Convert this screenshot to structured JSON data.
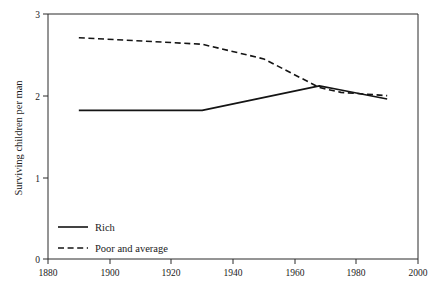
{
  "chart_data": {
    "type": "line",
    "title": "",
    "subtitle": "",
    "xlabel": "",
    "ylabel": "Surviving children per man",
    "xlim": [
      1880,
      2000
    ],
    "ylim": [
      0,
      3
    ],
    "xticks": [
      1880,
      1900,
      1920,
      1940,
      1960,
      1980,
      2000
    ],
    "xtick_labels": [
      "1880",
      "1900",
      "1920",
      "1940",
      "1960",
      "1980",
      "2000"
    ],
    "yticks": [
      0,
      1,
      2,
      3
    ],
    "ytick_labels": [
      "0",
      "1",
      "2",
      "3"
    ],
    "grid": false,
    "legend_position": "lower-left-inside",
    "series": [
      {
        "name": "Rich",
        "style": "solid",
        "color": "#141414",
        "x": [
          1890,
          1930,
          1968,
          1975,
          1990
        ],
        "values": [
          1.82,
          1.82,
          2.12,
          2.07,
          1.96
        ]
      },
      {
        "name": "Poor and average",
        "style": "dashed",
        "color": "#141414",
        "x": [
          1890,
          1930,
          1950,
          1968,
          1975,
          1990
        ],
        "values": [
          2.71,
          2.63,
          2.45,
          2.1,
          2.04,
          2.0
        ]
      }
    ]
  },
  "axes": {
    "y_axis_label": "Surviving children per man",
    "x_axis_label": ""
  },
  "legend": {
    "items": [
      {
        "label": "Rich",
        "style": "solid"
      },
      {
        "label": "Poor and average",
        "style": "dashed"
      }
    ]
  }
}
